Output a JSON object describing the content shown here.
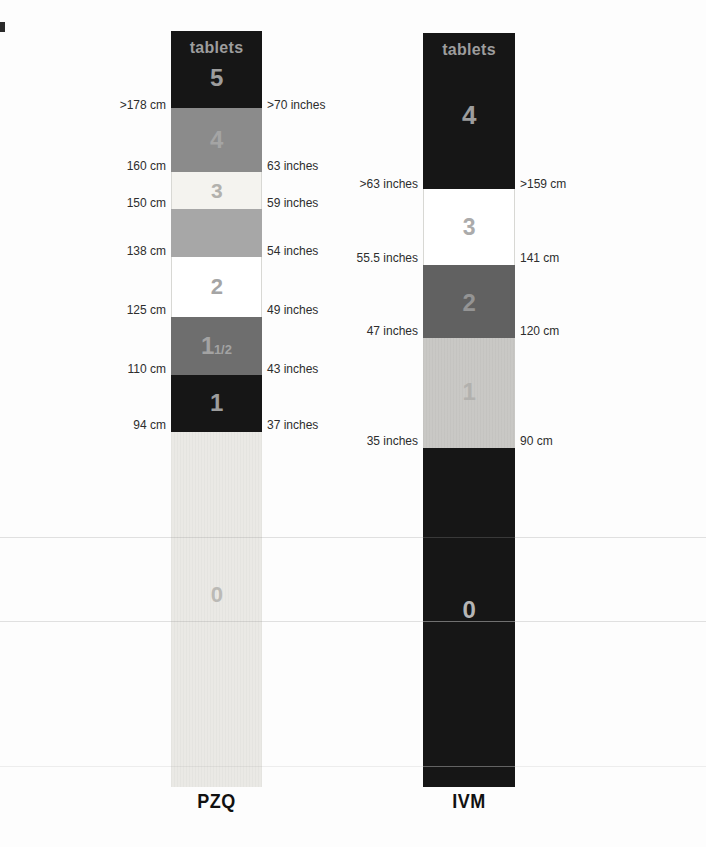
{
  "poles": [
    {
      "drug_label": "PZQ",
      "tablets_header": "tablets",
      "sections": [
        {
          "tablets": "5",
          "band_color": "#161616",
          "digit_color": "#9d9d9d"
        },
        {
          "tablets": "4",
          "band_color": "#8b8b8b",
          "digit_color": "#a4a4a4"
        },
        {
          "tablets": "3",
          "band_color": "#f4f3ef",
          "digit_color": "#b2b1ad"
        },
        {
          "tablets": "",
          "band_color": "#a7a7a7",
          "digit_color": "#a7a7a7"
        },
        {
          "tablets": "2",
          "band_color": "#ffffff",
          "digit_color": "#a5a5a5"
        },
        {
          "tablets": "1",
          "fraction": "1/2",
          "band_color": "#6e6e6e",
          "digit_color": "#a3a3a3"
        },
        {
          "tablets": "1",
          "band_color": "#161616",
          "digit_color": "#9d9d9d"
        },
        {
          "tablets": "0",
          "band_color": "#eae9e5",
          "digit_color": "#bbbab6"
        }
      ],
      "markers": [
        {
          "left": ">178 cm",
          "right": ">70 inches"
        },
        {
          "left": "160 cm",
          "right": "63 inches"
        },
        {
          "left": "150 cm",
          "right": "59 inches"
        },
        {
          "left": "138 cm",
          "right": "54 inches"
        },
        {
          "left": "125 cm",
          "right": "49 inches"
        },
        {
          "left": "110 cm",
          "right": "43 inches"
        },
        {
          "left": "94 cm",
          "right": "37 inches"
        }
      ]
    },
    {
      "drug_label": "IVM",
      "tablets_header": "tablets",
      "sections": [
        {
          "tablets": "4",
          "band_color": "#161616",
          "digit_color": "#9d9d9d"
        },
        {
          "tablets": "3",
          "band_color": "#ffffff",
          "digit_color": "#ababab"
        },
        {
          "tablets": "2",
          "band_color": "#616161",
          "digit_color": "#949494"
        },
        {
          "tablets": "1",
          "band_color": "#c9c8c5",
          "digit_color": "#b2b1ae"
        },
        {
          "tablets": "0",
          "band_color": "#161616",
          "digit_color": "#b5b5b5"
        }
      ],
      "markers": [
        {
          "left": ">63 inches",
          "right": ">159 cm"
        },
        {
          "left": "55.5 inches",
          "right": "141 cm"
        },
        {
          "left": "47 inches",
          "right": "120 cm"
        },
        {
          "left": "35 inches",
          "right": "90 cm"
        }
      ]
    }
  ],
  "colors": {
    "page_background": "#fdfdfd",
    "marker_text": "#2d2d2d",
    "drug_label_text": "#111111",
    "header_text": "#9d9d9d"
  }
}
